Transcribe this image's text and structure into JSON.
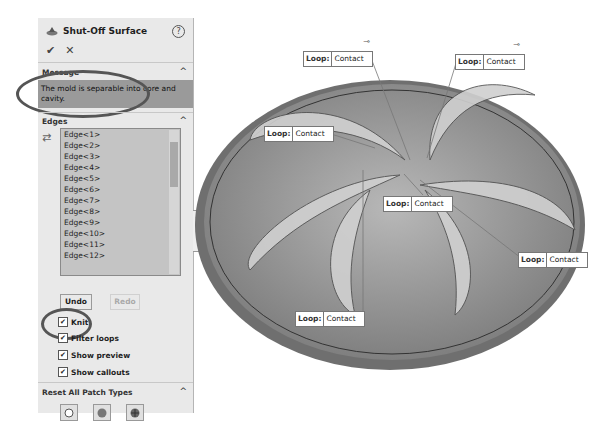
{
  "panel": {
    "title": "Shut-Off Surface",
    "help": "?",
    "ok": "✔",
    "cancel": "✕",
    "message_section": {
      "title": "Message",
      "text": "The mold is separable into core and cavity."
    },
    "edges_section": {
      "title": "Edges",
      "items": [
        "Edge<1>",
        "Edge<2>",
        "Edge<3>",
        "Edge<4>",
        "Edge<5>",
        "Edge<6>",
        "Edge<7>",
        "Edge<8>",
        "Edge<9>",
        "Edge<10>",
        "Edge<11>",
        "Edge<12>"
      ]
    },
    "undo": "Undo",
    "redo": "Redo",
    "checkboxes": [
      {
        "label": "Knit",
        "checked": true
      },
      {
        "label": "Filter loops",
        "checked": true
      },
      {
        "label": "Show preview",
        "checked": true
      },
      {
        "label": "Show callouts",
        "checked": true
      }
    ],
    "reset_section": {
      "title": "Reset All Patch Types",
      "buttons": [
        "no-fill-icon",
        "contact-icon",
        "tangent-icon"
      ]
    }
  },
  "callouts": [
    {
      "key": "Loop:",
      "value": "Contact"
    },
    {
      "key": "Loop:",
      "value": "Contact"
    },
    {
      "key": "Loop:",
      "value": "Contact"
    },
    {
      "key": "Loop:",
      "value": "Contact"
    },
    {
      "key": "Loop:",
      "value": "Contact"
    },
    {
      "key": "Loop:",
      "value": "Contact"
    }
  ]
}
